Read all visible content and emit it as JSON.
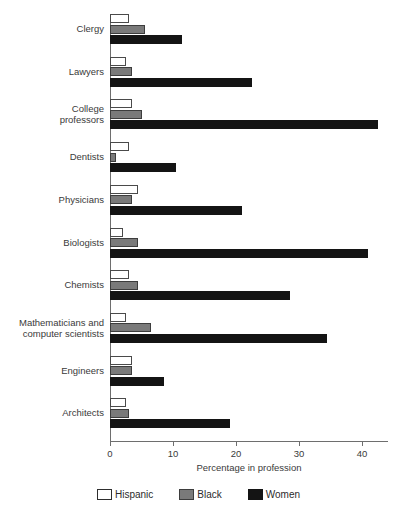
{
  "chart_data": {
    "type": "bar",
    "orientation": "horizontal",
    "title": "",
    "xlabel": "Percentage in profession",
    "ylabel": "",
    "xlim": [
      0,
      44
    ],
    "xticks": [
      0,
      10,
      20,
      30,
      40
    ],
    "grid": false,
    "legend_position": "bottom",
    "categories": [
      "Clergy",
      "Lawyers",
      "College\nprofessors",
      "Dentists",
      "Physicians",
      "Biologists",
      "Chemists",
      "Mathematicians and\ncomputer scientists",
      "Engineers",
      "Architects"
    ],
    "series": [
      {
        "name": "Hispanic",
        "color": "#ffffff",
        "values": [
          3.0,
          2.5,
          3.5,
          3.0,
          4.5,
          2.0,
          3.0,
          2.5,
          3.5,
          2.5
        ]
      },
      {
        "name": "Black",
        "color": "#7a7a7a",
        "values": [
          5.5,
          3.5,
          5.0,
          1.0,
          3.5,
          4.5,
          4.5,
          6.5,
          3.5,
          3.0
        ]
      },
      {
        "name": "Women",
        "color": "#141414",
        "values": [
          11.5,
          22.5,
          42.5,
          10.5,
          21.0,
          41.0,
          28.5,
          34.5,
          8.5,
          19.0
        ]
      }
    ]
  },
  "legend": {
    "items": [
      {
        "label": "Hispanic",
        "swatch": "hispanic"
      },
      {
        "label": "Black",
        "swatch": "black"
      },
      {
        "label": "Women",
        "swatch": "women"
      }
    ]
  },
  "footer": {
    "source_note": ""
  }
}
